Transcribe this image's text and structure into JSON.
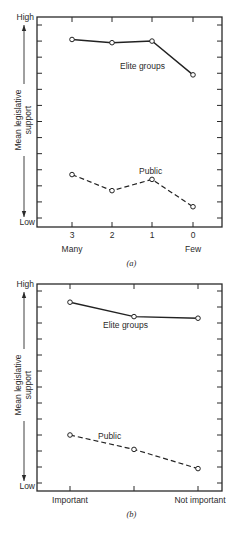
{
  "chart_data": [
    {
      "type": "line",
      "panel_label": "(a)",
      "title": "",
      "xlabel": "",
      "ylabel": "Mean legislative support",
      "ylabel_lines": [
        "Mean legislative",
        "support"
      ],
      "y_high_label": "High",
      "y_low_label": "Low",
      "ylim": [
        0,
        12
      ],
      "y_ticks": 13,
      "grid": false,
      "legend": "inline labels",
      "categories": [
        "3",
        "2",
        "1",
        "0"
      ],
      "category_sublabels": {
        "first": "Many",
        "last": "Few"
      },
      "series": [
        {
          "name": "Elite groups",
          "style": "solid",
          "values": [
            11.1,
            10.9,
            11.0,
            8.9
          ]
        },
        {
          "name": "Public",
          "style": "dashed",
          "values": [
            2.7,
            1.7,
            2.4,
            0.7
          ]
        }
      ]
    },
    {
      "type": "line",
      "panel_label": "(b)",
      "title": "",
      "xlabel": "",
      "ylabel": "Mean legislative support",
      "ylabel_lines": [
        "Mean legislative",
        "support"
      ],
      "y_high_label": "High",
      "y_low_label": "Low",
      "ylim": [
        0,
        12
      ],
      "y_ticks": 13,
      "grid": false,
      "legend": "inline labels",
      "categories": [
        "Important",
        "",
        "Not important"
      ],
      "series": [
        {
          "name": "Elite groups",
          "style": "solid",
          "values": [
            11.3,
            10.4,
            10.3
          ]
        },
        {
          "name": "Public",
          "style": "dashed",
          "values": [
            3.0,
            2.1,
            0.9
          ]
        }
      ]
    }
  ]
}
